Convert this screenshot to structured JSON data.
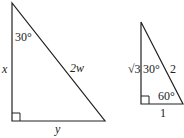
{
  "diagram": {
    "large_triangle": {
      "angle_top": "30°",
      "side_left": "x",
      "hypotenuse": "2w",
      "side_bottom": "y",
      "right_angle": "bottom-left"
    },
    "small_triangle": {
      "side_left": "√3",
      "angle_top": "30°",
      "hypotenuse": "2",
      "angle_bottom_right": "60°",
      "side_bottom": "1",
      "right_angle": "bottom-left"
    },
    "stroke_color": "#222222"
  }
}
